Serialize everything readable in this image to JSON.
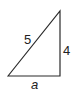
{
  "diagram": {
    "type": "right-triangle",
    "stroke_color": "#2a2a2a",
    "vertices": {
      "bottom_left": [
        8,
        76
      ],
      "top_right": [
        60,
        11
      ],
      "bottom_right": [
        60,
        76
      ]
    },
    "labels": {
      "hypotenuse": "5",
      "vertical_leg": "4",
      "base": "a"
    }
  }
}
